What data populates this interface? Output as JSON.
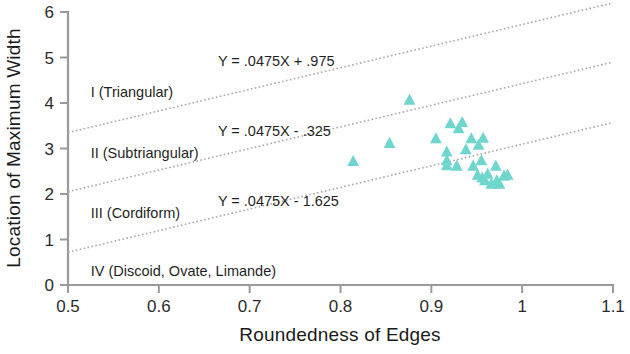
{
  "chart_data": {
    "type": "scatter",
    "title": "",
    "xlabel": "Roundedness of Edges",
    "ylabel": "Location of Maximum Width",
    "xlim": [
      0.5,
      1.1
    ],
    "ylim": [
      0,
      6
    ],
    "xticks": [
      "0.5",
      "0.6",
      "0.7",
      "0.8",
      "0.9",
      "1",
      "1.1"
    ],
    "xtick_values": [
      0.5,
      0.6,
      0.7,
      0.8,
      0.9,
      1.0,
      1.1
    ],
    "yticks": [
      "0",
      "1",
      "2",
      "3",
      "4",
      "5",
      "6"
    ],
    "ytick_values": [
      0,
      1,
      2,
      3,
      4,
      5,
      6
    ],
    "grid": false,
    "legend": "none",
    "marker_shape": "triangle",
    "marker_color": "#6fd6cd",
    "points": [
      {
        "x": 0.814,
        "y": 2.72
      },
      {
        "x": 0.854,
        "y": 3.12
      },
      {
        "x": 0.876,
        "y": 4.07
      },
      {
        "x": 0.905,
        "y": 3.22
      },
      {
        "x": 0.917,
        "y": 2.93
      },
      {
        "x": 0.917,
        "y": 2.74
      },
      {
        "x": 0.917,
        "y": 2.63
      },
      {
        "x": 0.928,
        "y": 2.62
      },
      {
        "x": 0.921,
        "y": 3.55
      },
      {
        "x": 0.93,
        "y": 3.44
      },
      {
        "x": 0.934,
        "y": 3.58
      },
      {
        "x": 0.938,
        "y": 2.98
      },
      {
        "x": 0.944,
        "y": 3.22
      },
      {
        "x": 0.946,
        "y": 2.62
      },
      {
        "x": 0.952,
        "y": 3.08
      },
      {
        "x": 0.955,
        "y": 2.74
      },
      {
        "x": 0.957,
        "y": 3.23
      },
      {
        "x": 0.951,
        "y": 2.42
      },
      {
        "x": 0.956,
        "y": 2.36
      },
      {
        "x": 0.959,
        "y": 2.3
      },
      {
        "x": 0.962,
        "y": 2.44
      },
      {
        "x": 0.966,
        "y": 2.22
      },
      {
        "x": 0.971,
        "y": 2.62
      },
      {
        "x": 0.972,
        "y": 2.3
      },
      {
        "x": 0.975,
        "y": 2.22
      },
      {
        "x": 0.98,
        "y": 2.4
      },
      {
        "x": 0.984,
        "y": 2.42
      }
    ],
    "trend_lines": [
      {
        "label": "Y = .0475X + .975",
        "intercept": 0.975,
        "slope": 0.0475,
        "y_at_xmin": 3.35,
        "y_at_xmax": 6.2
      },
      {
        "label": "Y = .0475X - .325",
        "intercept": -0.325,
        "slope": 0.0475,
        "y_at_xmin": 2.05,
        "y_at_xmax": 4.9
      },
      {
        "label": "Y = .0475X - 1.625",
        "intercept": -1.625,
        "slope": 0.0475,
        "y_at_xmin": 0.72,
        "y_at_xmax": 3.57
      }
    ],
    "region_labels": [
      {
        "text": "I  (Triangular)",
        "x": 0.525,
        "y": 4.25
      },
      {
        "text": "II  (Subtriangular)",
        "x": 0.525,
        "y": 2.9
      },
      {
        "text": "III  (Cordiform)",
        "x": 0.525,
        "y": 1.58
      },
      {
        "text": "IV  (Discoid, Ovate, Limande)",
        "x": 0.525,
        "y": 0.3
      }
    ],
    "equation_labels": [
      {
        "text": "Y = .0475X + .975",
        "x": 0.665,
        "y": 4.92
      },
      {
        "text": "Y = .0475X - .325",
        "x": 0.665,
        "y": 3.38
      },
      {
        "text": "Y = .0475X - 1.625",
        "x": 0.665,
        "y": 1.85
      }
    ]
  }
}
